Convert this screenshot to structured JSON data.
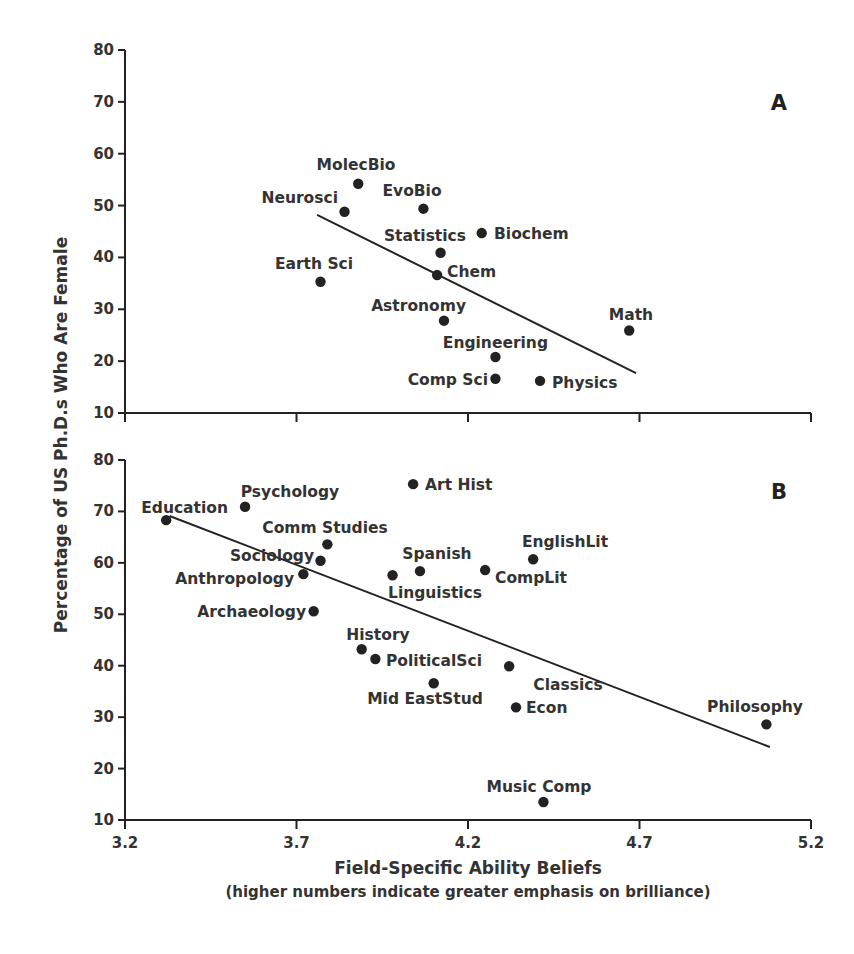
{
  "chart_data": [
    {
      "type": "scatter",
      "panel": "A",
      "title": "",
      "xlabel": "Field-Specific Ability Beliefs",
      "xlabel_sub": "(higher numbers indicate greater emphasis on brilliance)",
      "ylabel": "Percentage of US Ph.D.s Who Are Female",
      "xlim": [
        3.2,
        5.2
      ],
      "ylim": [
        10,
        80
      ],
      "xticks": [
        "3.2",
        "3.7",
        "4.2",
        "4.7",
        "5.2"
      ],
      "yticks": [
        "10",
        "20",
        "30",
        "40",
        "50",
        "60",
        "70",
        "80"
      ],
      "grid": false,
      "trendline": {
        "x": [
          3.76,
          4.69
        ],
        "y": [
          48.2,
          17.7
        ]
      },
      "points": [
        {
          "label": "MolecBio",
          "x": 3.88,
          "y": 54.2
        },
        {
          "label": "Neurosci",
          "x": 3.84,
          "y": 48.8
        },
        {
          "label": "EvoBio",
          "x": 4.07,
          "y": 49.4
        },
        {
          "label": "Biochem",
          "x": 4.24,
          "y": 44.7
        },
        {
          "label": "Statistics",
          "x": 4.12,
          "y": 40.9
        },
        {
          "label": "Chem",
          "x": 4.11,
          "y": 36.6
        },
        {
          "label": "Earth Sci",
          "x": 3.77,
          "y": 35.3
        },
        {
          "label": "Astronomy",
          "x": 4.13,
          "y": 27.8
        },
        {
          "label": "Math",
          "x": 4.67,
          "y": 25.9
        },
        {
          "label": "Engineering",
          "x": 4.28,
          "y": 20.8
        },
        {
          "label": "Comp Sci",
          "x": 4.28,
          "y": 16.6
        },
        {
          "label": "Physics",
          "x": 4.41,
          "y": 16.2
        }
      ]
    },
    {
      "type": "scatter",
      "panel": "B",
      "title": "",
      "xlabel": "Field-Specific Ability Beliefs",
      "xlabel_sub": "(higher numbers indicate greater emphasis on brilliance)",
      "ylabel": "Percentage of US Ph.D.s Who Are Female",
      "xlim": [
        3.2,
        5.2
      ],
      "ylim": [
        10,
        80
      ],
      "xticks": [
        "3.2",
        "3.7",
        "4.2",
        "4.7",
        "5.2"
      ],
      "yticks": [
        "10",
        "20",
        "30",
        "40",
        "50",
        "60",
        "70",
        "80"
      ],
      "grid": false,
      "trendline": {
        "x": [
          3.33,
          5.08
        ],
        "y": [
          69.1,
          24.2
        ]
      },
      "points": [
        {
          "label": "Art Hist",
          "x": 4.04,
          "y": 75.3
        },
        {
          "label": "Psychology",
          "x": 3.55,
          "y": 70.9
        },
        {
          "label": "Education",
          "x": 3.32,
          "y": 68.3
        },
        {
          "label": "Comm Studies",
          "x": 3.79,
          "y": 63.6
        },
        {
          "label": "Sociology",
          "x": 3.77,
          "y": 60.4
        },
        {
          "label": "EnglishLit",
          "x": 4.39,
          "y": 60.7
        },
        {
          "label": "Spanish",
          "x": 4.06,
          "y": 58.4
        },
        {
          "label": "CompLit",
          "x": 4.25,
          "y": 58.6
        },
        {
          "label": "Linguistics",
          "x": 3.98,
          "y": 57.6
        },
        {
          "label": "Anthropology",
          "x": 3.72,
          "y": 57.8
        },
        {
          "label": "Archaeology",
          "x": 3.75,
          "y": 50.6
        },
        {
          "label": "History",
          "x": 3.89,
          "y": 43.2
        },
        {
          "label": "PoliticalSci",
          "x": 3.93,
          "y": 41.3
        },
        {
          "label": "Classics",
          "x": 4.32,
          "y": 39.9
        },
        {
          "label": "Mid EastStud",
          "x": 4.1,
          "y": 36.6
        },
        {
          "label": "Econ",
          "x": 4.34,
          "y": 31.9
        },
        {
          "label": "Philosophy",
          "x": 5.07,
          "y": 28.6
        },
        {
          "label": "Music Comp",
          "x": 4.42,
          "y": 13.5
        }
      ]
    }
  ],
  "figure": {
    "panel_a_letter": "A",
    "panel_b_letter": "B",
    "ylabel": "Percentage of US Ph.D.s Who Are Female",
    "xlabel": "Field-Specific Ability Beliefs",
    "xlabel_sub": "(higher numbers indicate greater emphasis on brilliance)",
    "ink_color": "#222222",
    "background": "#ffffff"
  }
}
